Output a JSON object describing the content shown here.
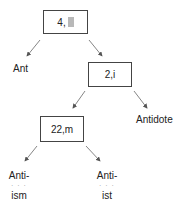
{
  "tree": {
    "root": {
      "label": "4,",
      "highlight": true
    },
    "left_leaf": {
      "label": "Ant"
    },
    "node_2": {
      "label": "2,i"
    },
    "right_leaf": {
      "label": "Antidote"
    },
    "node_3": {
      "label": "22,m"
    },
    "leaf_ism": {
      "prefix": "Anti-",
      "ellipsis": "· · ·",
      "suffix": "ism"
    },
    "leaf_ist": {
      "prefix": "Anti-",
      "ellipsis": "· · ·",
      "suffix": "ist"
    }
  },
  "colors": {
    "stroke": "#444444",
    "highlight": "#b8b8b8"
  }
}
